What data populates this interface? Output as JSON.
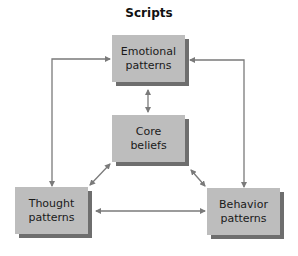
{
  "title": "Scripts",
  "nodes": {
    "emotional": {
      "line1": "Emotional",
      "line2": "patterns"
    },
    "core": {
      "line1": "Core",
      "line2": "beliefs"
    },
    "thought": {
      "line1": "Thought",
      "line2": "patterns"
    },
    "behavior": {
      "line1": "Behavior",
      "line2": "patterns"
    }
  },
  "colors": {
    "box": "#bdbdbd",
    "shadow": "#6e6e6e",
    "arrow": "#7a7a7a"
  }
}
